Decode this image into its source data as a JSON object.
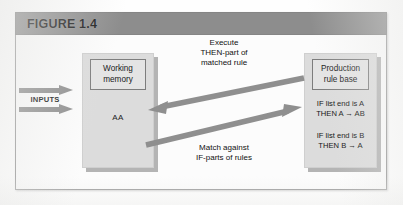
{
  "figure": {
    "title": "FIGURE 1.4",
    "colors": {
      "title_bar": "#8d8d8d",
      "panel_fill": "#dcdcdc",
      "panel_shadow": "#b4b4b4",
      "inner_box_fill": "#e4e4e4",
      "arrow_gray": "#8f8f8f",
      "frame_border": "#9a9a9a",
      "text": "#111111"
    }
  },
  "inputs": {
    "label": "INPUTS",
    "arrow_count": 2,
    "arrows": [
      {
        "name": "input-arrow-top",
        "direction": "right"
      },
      {
        "name": "input-arrow-bottom",
        "direction": "right"
      }
    ]
  },
  "working_memory": {
    "box_title_line1": "Working",
    "box_title_line2": "memory",
    "contents": "AA"
  },
  "rule_base": {
    "box_title_line1": "Production",
    "box_title_line2": "rule base",
    "rules": [
      {
        "if_line": "IF list end is A",
        "then_line": "THEN A → AB"
      },
      {
        "if_line": "IF list end is B",
        "then_line": "THEN B → A"
      }
    ]
  },
  "flows": {
    "execute": {
      "line1": "Execute",
      "line2": "THEN-part of",
      "line3": "matched rule",
      "direction": "rule-base-to-working-memory"
    },
    "match": {
      "line1": "Match against",
      "line2": "IF-parts of rules",
      "direction": "working-memory-to-rule-base"
    }
  }
}
